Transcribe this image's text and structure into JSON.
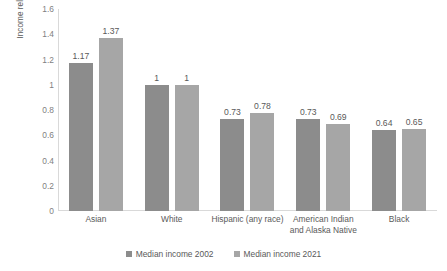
{
  "chart_data": {
    "type": "bar",
    "title": "",
    "xlabel": "",
    "ylabel": "Income relative to White houssholds",
    "ylim": [
      0,
      1.6
    ],
    "ytick_labels": [
      "1.6",
      "1.4",
      "1.2",
      "1",
      "0.8",
      "0.6",
      "0.4",
      "0.2",
      "0"
    ],
    "ytick_values": [
      1.6,
      1.4,
      1.2,
      1,
      0.8,
      0.6,
      0.4,
      0.2,
      0
    ],
    "grid": false,
    "legend_position": "bottom",
    "categories": [
      "Asian",
      "White",
      "Hispanic (any race)",
      "American Indian\nand Alaska Native",
      "Black"
    ],
    "category_lines": [
      [
        "Asian"
      ],
      [
        "White"
      ],
      [
        "Hispanic (any race)"
      ],
      [
        "American Indian",
        "and Alaska Native"
      ],
      [
        "Black"
      ]
    ],
    "series": [
      {
        "name": "Median income 2002",
        "color": "#8c8c8c",
        "values": [
          1.17,
          1,
          0.73,
          0.73,
          0.64
        ],
        "labels": [
          "1.17",
          "1",
          "0.73",
          "0.73",
          "0.64"
        ]
      },
      {
        "name": "Median income 2021",
        "color": "#a6a6a6",
        "values": [
          1.37,
          1,
          0.78,
          0.69,
          0.65
        ],
        "labels": [
          "1.37",
          "1",
          "0.78",
          "0.69",
          "0.65"
        ]
      }
    ]
  },
  "colors": {
    "series_2002": "#8c8c8c",
    "series_2021": "#a6a6a6",
    "axis": "#d9d9d9",
    "text": "#595959",
    "tick_text": "#7f7f7f"
  }
}
